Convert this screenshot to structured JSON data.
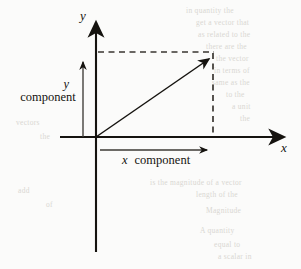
{
  "figure": {
    "background_color": "#fbfbfa",
    "ink_color": "#15130f",
    "dash_color": "#3a3631",
    "ghost_color": "#d9d7d2",
    "axes": {
      "y_axis_label": "y",
      "x_axis_label": "x",
      "origin": {
        "x": 96,
        "y": 137
      },
      "x_axis": {
        "x1": 60,
        "y1": 137,
        "x2": 288,
        "y2": 137
      },
      "y_axis": {
        "x1": 96,
        "y1": 18,
        "x2": 96,
        "y2": 252
      }
    },
    "vector": {
      "name": "resultant-vector",
      "tail": {
        "x": 96,
        "y": 137
      },
      "tip": {
        "x": 213,
        "y": 56
      }
    },
    "components": {
      "y_component": {
        "label_variable": "y",
        "label_word": "component",
        "arrow": {
          "x1": 83,
          "y1": 137,
          "x2": 83,
          "y2": 57
        }
      },
      "x_component": {
        "label_variable": "x",
        "label_word": "component",
        "arrow": {
          "x1": 100,
          "y1": 150,
          "x2": 212,
          "y2": 150
        }
      }
    },
    "projection_lines": {
      "horizontal_dashed": {
        "x1": 98,
        "y1": 52,
        "x2": 213,
        "y2": 52
      },
      "vertical_dashed": {
        "x1": 213,
        "y1": 54,
        "x2": 213,
        "y2": 137
      }
    }
  },
  "ghost_text": [
    {
      "text": "in quantity the",
      "x": 186,
      "y": 6
    },
    {
      "text": "get a vector that",
      "x": 196,
      "y": 18
    },
    {
      "text": "as related to the",
      "x": 198,
      "y": 30
    },
    {
      "text": "there are the",
      "x": 206,
      "y": 42
    },
    {
      "text": "the vector",
      "x": 216,
      "y": 54
    },
    {
      "text": "in terms of",
      "x": 214,
      "y": 66
    },
    {
      "text": "same as the",
      "x": 212,
      "y": 78
    },
    {
      "text": "to the",
      "x": 226,
      "y": 90
    },
    {
      "text": "a unit",
      "x": 232,
      "y": 102
    },
    {
      "text": "the",
      "x": 240,
      "y": 114
    },
    {
      "text": "is the magnitude of a vector",
      "x": 150,
      "y": 178
    },
    {
      "text": "length of the",
      "x": 196,
      "y": 190
    },
    {
      "text": "Magnitude",
      "x": 206,
      "y": 206
    },
    {
      "text": "A quantity",
      "x": 200,
      "y": 226
    },
    {
      "text": "equal to",
      "x": 214,
      "y": 240
    },
    {
      "text": "a scalar in",
      "x": 218,
      "y": 252
    },
    {
      "text": "vectors",
      "x": 16,
      "y": 118
    },
    {
      "text": "the",
      "x": 40,
      "y": 132
    },
    {
      "text": "add",
      "x": 18,
      "y": 186
    },
    {
      "text": "of",
      "x": 46,
      "y": 200
    }
  ]
}
